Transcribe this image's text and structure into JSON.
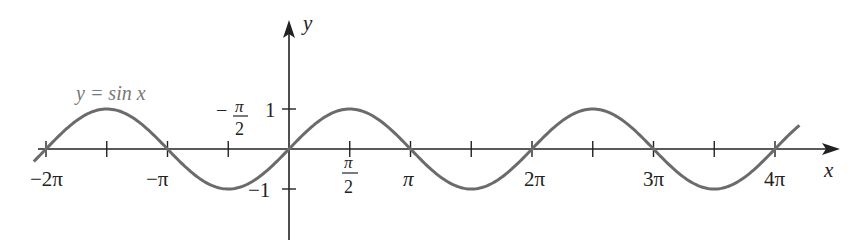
{
  "chart_data": {
    "type": "line",
    "title": "",
    "function_label": "y = sin x",
    "xlabel": "x",
    "ylabel": "y",
    "x_range": [
      -6.6,
      13.2
    ],
    "y_range": [
      -1.0,
      1.0
    ],
    "grid": false,
    "legend": "none",
    "x_ticks": [
      {
        "value": -6.2832,
        "label": "−2π"
      },
      {
        "value": -4.7124,
        "label": ""
      },
      {
        "value": -3.1416,
        "label": "−π"
      },
      {
        "value": -1.5708,
        "label": "−π/2"
      },
      {
        "value": 0,
        "label": ""
      },
      {
        "value": 1.5708,
        "label": "π/2"
      },
      {
        "value": 3.1416,
        "label": "π"
      },
      {
        "value": 4.7124,
        "label": ""
      },
      {
        "value": 6.2832,
        "label": "2π"
      },
      {
        "value": 7.854,
        "label": ""
      },
      {
        "value": 9.4248,
        "label": "3π"
      },
      {
        "value": 10.9956,
        "label": ""
      },
      {
        "value": 12.5664,
        "label": "4π"
      }
    ],
    "y_ticks": [
      {
        "value": 1,
        "label": "1"
      },
      {
        "value": -1,
        "label": "−1"
      }
    ],
    "series": [
      {
        "name": "y = sin x",
        "function": "sin",
        "x_start": -6.6,
        "x_end": 13.2,
        "color": "#6b6b6b"
      }
    ]
  },
  "labels": {
    "function": "y = sin x",
    "x_axis": "x",
    "y_axis": "y",
    "neg_two_pi": "−2π",
    "neg_pi": "−π",
    "neg_half_pi_num": "π",
    "neg_half_pi_den": "2",
    "neg_sign": "−",
    "half_pi_num": "π",
    "half_pi_den": "2",
    "pi": "π",
    "two_pi": "2π",
    "three_pi": "3π",
    "four_pi": "4π",
    "y_one": "1",
    "y_neg_one": "−1"
  },
  "colors": {
    "axis": "#222222",
    "curve": "#6b6b6b",
    "label_gray": "#777777"
  }
}
